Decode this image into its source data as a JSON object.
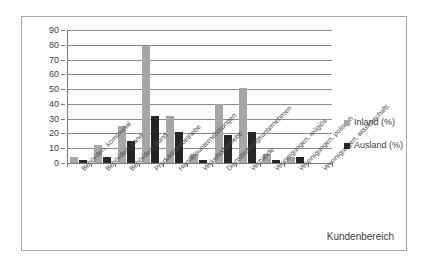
{
  "chart_data": {
    "type": "bar",
    "title": "",
    "xlabel": "Kundenbereich",
    "ylabel": "",
    "ylim": [
      0,
      90
    ],
    "ytick_step": 10,
    "yticks": [
      90,
      80,
      70,
      60,
      50,
      40,
      30,
      20,
      10,
      0
    ],
    "grid": true,
    "legend_position": "right",
    "categories": [
      "Behörden, kommunal",
      "Behörden, Land",
      "Behörden, Bund",
      "Produktionsbetriebe",
      "Handelsunternehmungen",
      "Verkehrsbetriebe",
      "Dienstleistungsunternehmen",
      "Verbände",
      "Vereinigungen, religiös",
      "Vereinigungen, politisch",
      "Vereinigungen, wissenschaftl."
    ],
    "series": [
      {
        "name": "Inland (%)",
        "color": "#a6a6a6",
        "values": [
          4,
          12,
          25,
          79,
          32,
          6,
          40,
          51,
          6,
          4,
          0
        ]
      },
      {
        "name": "Ausland (%)",
        "color": "#262626",
        "values": [
          2,
          4,
          15,
          32,
          21,
          2,
          19,
          21,
          2,
          4,
          0
        ]
      }
    ]
  },
  "legend": {
    "items": [
      {
        "label": "Inland (%)",
        "color": "#a6a6a6"
      },
      {
        "label": "Ausland (%)",
        "color": "#262626"
      }
    ]
  },
  "axis_title": "Kundenbereich"
}
